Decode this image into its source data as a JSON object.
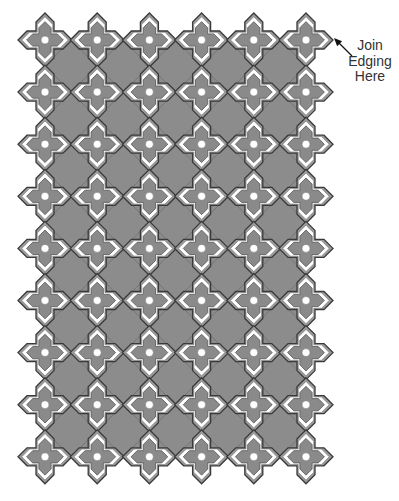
{
  "diagram": {
    "type": "crochet-motif-layout",
    "grid": {
      "columns": 6,
      "rows": 9,
      "origin_x": 45,
      "origin_y": 40,
      "spacing_x": 52.2,
      "spacing_y": 52.1
    },
    "motif": {
      "shape": "four-armed cross with pointed tips",
      "outer_radius": 27,
      "center_dot_radius": 4
    },
    "colors": {
      "background": "#ffffff",
      "fill_gray": "#8c8c8c",
      "motif_gray": "#8a8a8a",
      "motif_band": "#ffffff",
      "outline": "#3a3a3a",
      "join_mark": "#111111"
    }
  },
  "annotation": {
    "lines": [
      "Join",
      "Edging",
      "Here"
    ],
    "arrow": {
      "from": [
        352,
        56
      ],
      "to": [
        334,
        38
      ]
    }
  }
}
